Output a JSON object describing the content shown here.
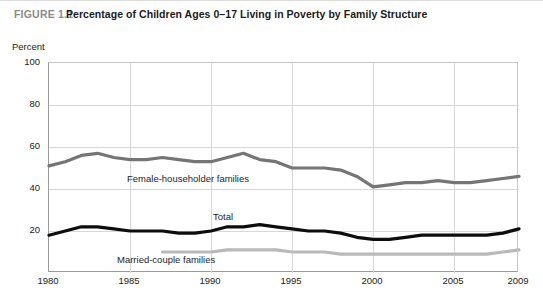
{
  "figure": {
    "number_label": "FIGURE 1.1",
    "title": "Percentage of Children Ages 0–17 Living in Poverty by Family Structure"
  },
  "axis": {
    "y_axis_label": "Percent",
    "y_ticks": [
      "100",
      "80",
      "60",
      "40",
      "20"
    ],
    "x_ticks": [
      "1980",
      "1985",
      "1990",
      "1995",
      "2000",
      "2005",
      "2009"
    ]
  },
  "labels": {
    "female_householder": "Female-householder families",
    "total": "Total",
    "married_couple": "Married-couple families"
  },
  "colors": {
    "female_householder": "#757575",
    "total": "#0d0d0d",
    "married_couple": "#b9b9b9",
    "grid": "#d7d7d7",
    "axis": "#9b9b9b",
    "figure_number": "#8a8a8a",
    "title": "#1b1b1b"
  },
  "chart_data": {
    "type": "line",
    "title": "Percentage of Children Ages 0–17 Living in Poverty by Family Structure",
    "xlabel": "",
    "ylabel": "Percent",
    "xlim": [
      1980,
      2009
    ],
    "ylim": [
      0,
      100
    ],
    "grid": true,
    "legend": "inline-labels",
    "x": [
      1980,
      1981,
      1982,
      1983,
      1984,
      1985,
      1986,
      1987,
      1988,
      1989,
      1990,
      1991,
      1992,
      1993,
      1994,
      1995,
      1996,
      1997,
      1998,
      1999,
      2000,
      2001,
      2002,
      2003,
      2004,
      2005,
      2006,
      2007,
      2008,
      2009
    ],
    "series": [
      {
        "name": "Female-householder families",
        "color": "#757575",
        "values": [
          51,
          53,
          56,
          57,
          55,
          54,
          54,
          55,
          54,
          53,
          53,
          55,
          57,
          54,
          53,
          50,
          50,
          50,
          49,
          46,
          41,
          42,
          43,
          43,
          44,
          43,
          43,
          44,
          45,
          46
        ]
      },
      {
        "name": "Total",
        "color": "#0d0d0d",
        "values": [
          18,
          20,
          22,
          22,
          21,
          20,
          20,
          20,
          19,
          19,
          20,
          22,
          22,
          23,
          22,
          21,
          20,
          20,
          19,
          17,
          16,
          16,
          17,
          18,
          18,
          18,
          18,
          18,
          19,
          21
        ]
      },
      {
        "name": "Married-couple families",
        "color": "#b9b9b9",
        "x_start": 1987,
        "values": [
          null,
          null,
          null,
          null,
          null,
          null,
          null,
          10,
          10,
          10,
          10,
          11,
          11,
          11,
          11,
          10,
          10,
          10,
          9,
          9,
          9,
          9,
          9,
          9,
          9,
          9,
          9,
          9,
          10,
          11
        ]
      }
    ]
  }
}
